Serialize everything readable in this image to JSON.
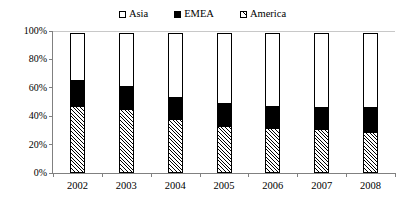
{
  "chart_data": {
    "type": "bar",
    "stacked": true,
    "stack_mode": "percent",
    "title": "",
    "subtitle": "",
    "xlabel": "",
    "ylabel": "",
    "categories": [
      "2002",
      "2003",
      "2004",
      "2005",
      "2006",
      "2007",
      "2008"
    ],
    "series": [
      {
        "name": "America",
        "values": [
          47,
          45,
          38,
          33,
          32,
          31,
          29
        ]
      },
      {
        "name": "EMEA",
        "values": [
          19,
          17,
          16,
          17,
          16,
          16,
          18
        ]
      },
      {
        "name": "Asia",
        "values": [
          34,
          38,
          46,
          50,
          52,
          53,
          53
        ]
      }
    ],
    "stack_order_bottom_to_top": [
      "America",
      "EMEA",
      "Asia"
    ],
    "ylim": [
      0,
      100
    ],
    "yticks": [
      0,
      20,
      40,
      60,
      80,
      100
    ],
    "ytick_labels": [
      "0%",
      "20%",
      "40%",
      "60%",
      "80%",
      "100%"
    ],
    "xtick_labels": [
      "2002",
      "2003",
      "2004",
      "2005",
      "2006",
      "2007",
      "2008"
    ],
    "grid": false,
    "legend_position": "top-center",
    "legend_order": [
      "Asia",
      "EMEA",
      "America"
    ],
    "annotations": []
  },
  "legend": {
    "items": [
      {
        "label": "Asia",
        "swatch": "asia-swatch-icon",
        "fill": "#ffffff"
      },
      {
        "label": "EMEA",
        "swatch": "emea-swatch-icon",
        "fill": "#000000"
      },
      {
        "label": "America",
        "swatch": "america-swatch-icon",
        "fill": "hatched"
      }
    ]
  },
  "axes": {
    "y_tick_labels": [
      "100%",
      "80%",
      "60%",
      "40%",
      "20%",
      "0%"
    ],
    "x_tick_labels": [
      "2002",
      "2003",
      "2004",
      "2005",
      "2006",
      "2007",
      "2008"
    ]
  },
  "colors": {
    "asia": "#ffffff",
    "emea": "#000000",
    "america_line": "#000000",
    "america_bg": "#ffffff",
    "axis": "#808080",
    "text": "#000000",
    "background": "#ffffff"
  }
}
